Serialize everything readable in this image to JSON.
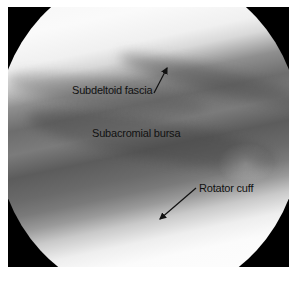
{
  "image": {
    "description": "Arthroscopic view of the shoulder subacromial space",
    "labels": [
      {
        "id": "subdeltoid",
        "text": "Subdeltoid fascia"
      },
      {
        "id": "subacromial",
        "text": "Subacromial bursa"
      },
      {
        "id": "rotator",
        "text": "Rotator cuff"
      }
    ]
  }
}
